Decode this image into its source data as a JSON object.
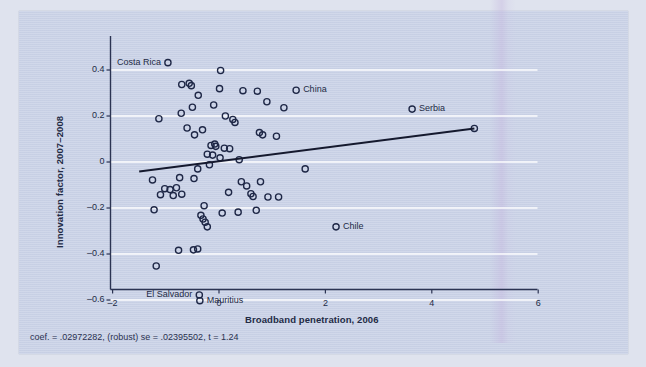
{
  "chart_data": {
    "type": "scatter",
    "title": "",
    "xlabel": "Broadband penetration, 2006",
    "ylabel": "Innovation factor, 2007–2008",
    "xlim": [
      -2.4,
      6.3
    ],
    "ylim": [
      -0.67,
      0.5
    ],
    "xticks": [
      -2,
      0,
      2,
      4,
      6
    ],
    "xticklabels": [
      "–2",
      "0",
      "2",
      "4",
      "6"
    ],
    "yticks": [
      0.4,
      0.2,
      0,
      -0.2,
      -0.4,
      -0.6
    ],
    "yticklabels": [
      "0.4",
      "0.2",
      "0",
      "–0.2",
      "–0.4",
      "–0.6"
    ],
    "grid": "horizontal-white",
    "legend": "none",
    "marker": "open-circle",
    "marker_color": "#1e2746",
    "fit_line": {
      "type": "linear-fit",
      "color": "#15192e",
      "x0": -1.5,
      "y0": -0.0415,
      "x1": 4.8,
      "y1": 0.1458,
      "slope": 0.02972282,
      "intercept": 0.003,
      "label": "coef. = .02972282, (robust) se = .02395502, t = 1.24"
    },
    "annotations": [
      {
        "label": "Costa Rica",
        "x": -0.96,
        "y": 0.432,
        "label_side": "left"
      },
      {
        "label": "China",
        "x": 1.45,
        "y": 0.312,
        "label_side": "right"
      },
      {
        "label": "Serbia",
        "x": 3.63,
        "y": 0.23,
        "label_side": "right"
      },
      {
        "label": "Chile",
        "x": 2.2,
        "y": -0.282,
        "label_side": "right"
      },
      {
        "label": "El Salvador",
        "x": -0.37,
        "y": -0.578,
        "label_side": "left"
      },
      {
        "label": "Mauritius",
        "x": -0.36,
        "y": -0.603,
        "label_side": "right"
      }
    ],
    "points": [
      {
        "x": -0.96,
        "y": 0.432
      },
      {
        "x": 0.03,
        "y": 0.398
      },
      {
        "x": -0.7,
        "y": 0.337
      },
      {
        "x": -0.56,
        "y": 0.342
      },
      {
        "x": -0.52,
        "y": 0.332
      },
      {
        "x": 0.01,
        "y": 0.319
      },
      {
        "x": 0.45,
        "y": 0.31
      },
      {
        "x": 0.72,
        "y": 0.308
      },
      {
        "x": 1.45,
        "y": 0.312
      },
      {
        "x": -0.39,
        "y": 0.29
      },
      {
        "x": -0.1,
        "y": 0.248
      },
      {
        "x": 0.9,
        "y": 0.262
      },
      {
        "x": -0.5,
        "y": 0.238
      },
      {
        "x": -0.71,
        "y": 0.212
      },
      {
        "x": 1.22,
        "y": 0.236
      },
      {
        "x": -1.13,
        "y": 0.188
      },
      {
        "x": 0.12,
        "y": 0.2
      },
      {
        "x": 0.26,
        "y": 0.185
      },
      {
        "x": 0.3,
        "y": 0.172
      },
      {
        "x": 3.63,
        "y": 0.23
      },
      {
        "x": -0.6,
        "y": 0.148
      },
      {
        "x": -0.31,
        "y": 0.14
      },
      {
        "x": -0.46,
        "y": 0.118
      },
      {
        "x": 0.76,
        "y": 0.128
      },
      {
        "x": 0.82,
        "y": 0.118
      },
      {
        "x": 1.08,
        "y": 0.112
      },
      {
        "x": -0.15,
        "y": 0.072
      },
      {
        "x": -0.08,
        "y": 0.078
      },
      {
        "x": -0.06,
        "y": 0.068
      },
      {
        "x": 0.1,
        "y": 0.06
      },
      {
        "x": 0.2,
        "y": 0.058
      },
      {
        "x": -0.22,
        "y": 0.034
      },
      {
        "x": -0.12,
        "y": 0.03
      },
      {
        "x": 0.02,
        "y": 0.018
      },
      {
        "x": 0.38,
        "y": 0.01
      },
      {
        "x": -0.18,
        "y": -0.012
      },
      {
        "x": -0.4,
        "y": -0.03
      },
      {
        "x": 4.8,
        "y": 0.146
      },
      {
        "x": 1.62,
        "y": -0.03
      },
      {
        "x": -1.25,
        "y": -0.078
      },
      {
        "x": -0.74,
        "y": -0.068
      },
      {
        "x": -0.47,
        "y": -0.072
      },
      {
        "x": 0.42,
        "y": -0.086
      },
      {
        "x": 0.78,
        "y": -0.086
      },
      {
        "x": -1.02,
        "y": -0.116
      },
      {
        "x": -0.92,
        "y": -0.12
      },
      {
        "x": -0.8,
        "y": -0.112
      },
      {
        "x": -1.1,
        "y": -0.142
      },
      {
        "x": -0.86,
        "y": -0.146
      },
      {
        "x": -0.7,
        "y": -0.14
      },
      {
        "x": 0.18,
        "y": -0.132
      },
      {
        "x": 0.6,
        "y": -0.138
      },
      {
        "x": 0.64,
        "y": -0.15
      },
      {
        "x": 0.92,
        "y": -0.152
      },
      {
        "x": 1.12,
        "y": -0.152
      },
      {
        "x": 0.52,
        "y": -0.104
      },
      {
        "x": -1.22,
        "y": -0.208
      },
      {
        "x": -0.28,
        "y": -0.19
      },
      {
        "x": -0.34,
        "y": -0.232
      },
      {
        "x": -0.3,
        "y": -0.248
      },
      {
        "x": -0.26,
        "y": -0.262
      },
      {
        "x": -0.22,
        "y": -0.282
      },
      {
        "x": 0.06,
        "y": -0.222
      },
      {
        "x": 0.36,
        "y": -0.218
      },
      {
        "x": 0.7,
        "y": -0.21
      },
      {
        "x": 2.2,
        "y": -0.282
      },
      {
        "x": -0.76,
        "y": -0.384
      },
      {
        "x": -0.48,
        "y": -0.382
      },
      {
        "x": -0.4,
        "y": -0.378
      },
      {
        "x": -1.18,
        "y": -0.452
      },
      {
        "x": -0.37,
        "y": -0.578
      },
      {
        "x": -0.36,
        "y": -0.603
      }
    ]
  },
  "footnote": {
    "text": "coef. = .02972282, (robust) se = .02395502, t = 1.24"
  }
}
